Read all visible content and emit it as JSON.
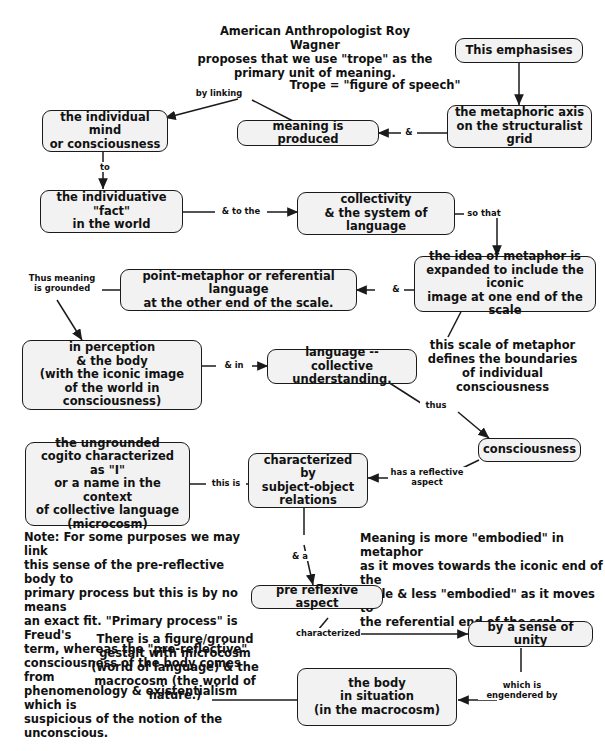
{
  "diagram": {
    "background": "#ffffff",
    "node_fill": "#f2f2f2",
    "node_stroke": "#1a1a1a",
    "notes": [
      {
        "id": "intro",
        "text": "American Anthropologist Roy Wagner\nproposes that we use \"trope\" as the\nprimary unit of meaning."
      },
      {
        "id": "trope-def",
        "text": "Trope = \"figure of speech\""
      },
      {
        "id": "scale-boundaries",
        "text": "this scale of metaphor\ndefines the boundaries\nof individual consciousness"
      },
      {
        "id": "freud-note",
        "text": "Note: For some purposes we may link\nthis sense of the pre-reflective body to\nprimary process but this is by no means\nan exact fit. \"Primary process\" is Freud's\nterm, whereas the \"pre-reflective\"\nconsciousness of the body comes from\nphenomenology & existentialism which is\nsuspicious of the notion of the unconscious."
      },
      {
        "id": "embodiment-note",
        "text": "Meaning is more \"embodied\" in metaphor\nas it moves towards the iconic end of the\nscale & less \"embodied\" as it moves to\nthe referential end of the scale"
      },
      {
        "id": "gestalt-note",
        "text": "There is a figure/ground\ngestalt with microcosm\n(world of language) & the\nmacrocosm (the world of\nnature.)"
      }
    ],
    "nodes": [
      {
        "id": "this-emphasises",
        "text": "This emphasises"
      },
      {
        "id": "individual-mind",
        "text": "the individual mind\nor consciousness"
      },
      {
        "id": "meaning-produced",
        "text": "meaning is produced"
      },
      {
        "id": "metaphoric-axis",
        "text": "the metaphoric axis\non the structuralist grid"
      },
      {
        "id": "individuative-fact",
        "text": "the individuative \"fact\"\nin the world"
      },
      {
        "id": "collectivity",
        "text": "collectivity\n& the system of language"
      },
      {
        "id": "point-metaphor",
        "text": "point-metaphor or referential language\nat the other end of the scale."
      },
      {
        "id": "idea-of-metaphor",
        "text": "the idea of metaphor is\nexpanded to include the iconic\nimage at one end of the scale"
      },
      {
        "id": "in-perception",
        "text": "in perception\n& the body\n(with the iconic image\nof the world in consciousness)"
      },
      {
        "id": "language-collective",
        "text": "language --\ncollective understanding."
      },
      {
        "id": "consciousness",
        "text": "consciousness"
      },
      {
        "id": "ungrounded-cogito",
        "text": "the ungrounded\ncogito characterized as \"I\"\nor a name in the context\nof collective language\n(microcosm)"
      },
      {
        "id": "subject-object",
        "text": "characterized by\nsubject-object\nrelations"
      },
      {
        "id": "pre-reflexive",
        "text": "pre reflexive aspect"
      },
      {
        "id": "sense-of-unity",
        "text": "by a sense of unity"
      },
      {
        "id": "body-in-situation",
        "text": "the body\nin situation\n(in the macrocosm)"
      }
    ],
    "edge_labels": [
      {
        "id": "by-linking",
        "text": "by linking"
      },
      {
        "id": "to",
        "text": "to"
      },
      {
        "id": "amp-1",
        "text": "&"
      },
      {
        "id": "and-to-the",
        "text": "& to the"
      },
      {
        "id": "so-that",
        "text": "so that"
      },
      {
        "id": "amp-2",
        "text": "&"
      },
      {
        "id": "thus-meaning-grounded",
        "text": "Thus meaning\nis grounded"
      },
      {
        "id": "and-in",
        "text": "& in"
      },
      {
        "id": "thus",
        "text": "thus"
      },
      {
        "id": "this-is",
        "text": "this is"
      },
      {
        "id": "has-reflective-aspect",
        "text": "has a reflective\naspect"
      },
      {
        "id": "and-a",
        "text": "& a"
      },
      {
        "id": "characterized",
        "text": "characterized"
      },
      {
        "id": "which-is-engendered-by",
        "text": "which is\nengendered by"
      }
    ]
  }
}
